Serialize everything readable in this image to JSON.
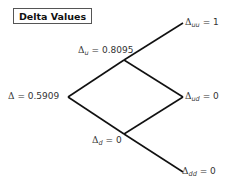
{
  "title": "Delta Values",
  "nodes": {
    "root": {
      "symbol": "Δ",
      "sub": "",
      "value": "= 0.5909"
    },
    "u": {
      "symbol": "Δ",
      "sub": "u",
      "value": "= 0.8095"
    },
    "d": {
      "symbol": "Δ",
      "sub": "d",
      "value": "= 0"
    },
    "uu": {
      "symbol": "Δ",
      "sub": "uu",
      "value": "= 1"
    },
    "ud": {
      "symbol": "Δ",
      "sub": "ud",
      "value": "= 0"
    },
    "dd": {
      "symbol": "Δ",
      "sub": "dd",
      "value": "= 0"
    }
  },
  "colors": {
    "line": "#111111",
    "text": "#333333",
    "border": "#555555"
  }
}
